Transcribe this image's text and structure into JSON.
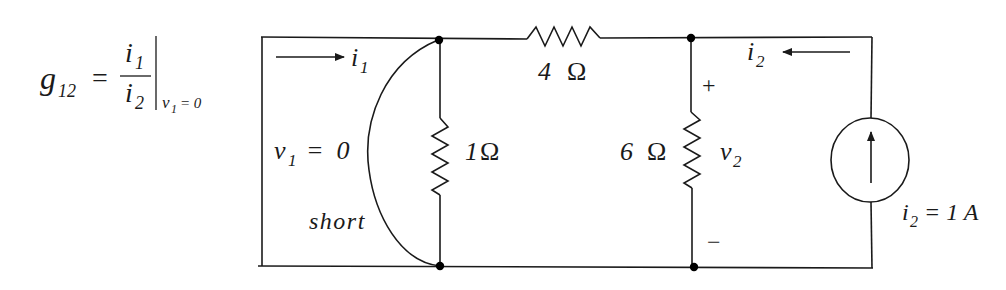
{
  "formula": {
    "lhs": "g",
    "lhs_sub": "12",
    "equals": "=",
    "num": "i",
    "num_sub": "1",
    "den": "i",
    "den_sub": "2",
    "cond_var": "v",
    "cond_sub": "1",
    "cond_rest": "= 0"
  },
  "circuit": {
    "i1_label": "i",
    "i1_sub": "1",
    "i2_label": "i",
    "i2_sub": "2",
    "v1_label": "v",
    "v1_sub": "1",
    "v1_value": "=  0",
    "short_label": "short",
    "r_series": {
      "value": "4",
      "unit": "Ω"
    },
    "r_left": {
      "value": "1",
      "unit": "Ω"
    },
    "r_right": {
      "value": "6",
      "unit": "Ω"
    },
    "v2_label": "v",
    "v2_sub": "2",
    "plus": "+",
    "minus": "−",
    "source_label": "i",
    "source_sub": "2",
    "source_value": "= 1 A"
  }
}
